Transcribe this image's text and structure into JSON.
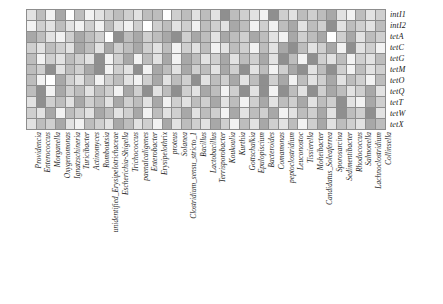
{
  "figure": {
    "type": "heatmap",
    "significance_marker": "*"
  },
  "chart_data": {
    "type": "heatmap",
    "title": "",
    "xlabel": "",
    "ylabel": "",
    "grid": true,
    "legend": "none",
    "colorscale": {
      "name": "grayscale",
      "levels": [
        "#ffffff",
        "#f2f2f2",
        "#e2e2e2",
        "#cfcfcf",
        "#bdbdbd",
        "#a8a8a8",
        "#8f8f8f"
      ],
      "low_label": "",
      "high_label": ""
    },
    "rows": [
      "intI1",
      "intI2",
      "tetA",
      "tetC",
      "tetG",
      "tetM",
      "tetO",
      "tetQ",
      "tetT",
      "tetW",
      "tetX"
    ],
    "columns": [
      "Providencia",
      "Enterococcus",
      "Morganella",
      "Oxygenomonas",
      "Ignatzschineria",
      "Turicibacter",
      "Actinomyces",
      "Romboutsia",
      "unidentified_Erysipelotrichaceae",
      "Escherichia-Shigella",
      "Trichococcus",
      "paenalcaligenes",
      "Enterobacter",
      "Erysipelothrix",
      "proteus",
      "Solanea",
      "Clostridium_sensu_stricto_1",
      "Bacillus",
      "Lactobacillus",
      "Terrisporobacter",
      "Koukoulia",
      "Kurthia",
      "Gottschalkia",
      "Epulopiscium",
      "Bacteroides",
      "Comamonas",
      "peptoclostridium",
      "Leuconostoc",
      "Tissierella",
      "Moheibacter",
      "Candidatus_Soleaferrea",
      "Sporosarcina",
      "Sedimentibacter",
      "Rhodococcus",
      "Salmonella",
      "Lachnoclostridium",
      "Collinsella"
    ],
    "values": [
      [
        2,
        4,
        1,
        5,
        0,
        4,
        1,
        2,
        3,
        4,
        3,
        2,
        4,
        4,
        0,
        3,
        4,
        2,
        4,
        2,
        6,
        4,
        3,
        2,
        1,
        6,
        3,
        2,
        4,
        3,
        4,
        5,
        2,
        1,
        4,
        2,
        3
      ],
      [
        1,
        3,
        2,
        4,
        2,
        1,
        3,
        1,
        4,
        2,
        1,
        3,
        0,
        3,
        4,
        2,
        3,
        1,
        4,
        3,
        2,
        5,
        4,
        1,
        3,
        1,
        4,
        5,
        2,
        4,
        3,
        6,
        2,
        4,
        3,
        2,
        4
      ],
      [
        5,
        4,
        2,
        1,
        3,
        5,
        4,
        3,
        0,
        7,
        4,
        5,
        3,
        4,
        5,
        7,
        3,
        5,
        4,
        2,
        5,
        4,
        3,
        5,
        4,
        2,
        1,
        5,
        3,
        4,
        5,
        0,
        3,
        5,
        2,
        4,
        3
      ],
      [
        3,
        2,
        4,
        3,
        2,
        5,
        4,
        2,
        5,
        3,
        4,
        5,
        3,
        2,
        4,
        1,
        3,
        2,
        4,
        1,
        2,
        4,
        3,
        1,
        4,
        2,
        5,
        6,
        4,
        2,
        3,
        5,
        1,
        7,
        2,
        3,
        1
      ],
      [
        4,
        1,
        3,
        2,
        4,
        3,
        2,
        6,
        1,
        3,
        5,
        1,
        4,
        2,
        5,
        1,
        5,
        4,
        2,
        3,
        5,
        2,
        4,
        3,
        5,
        2,
        6,
        4,
        1,
        7,
        3,
        2,
        4,
        1,
        3,
        2,
        4
      ],
      [
        4,
        3,
        6,
        2,
        4,
        3,
        5,
        6,
        1,
        3,
        2,
        6,
        1,
        5,
        4,
        2,
        5,
        3,
        4,
        2,
        5,
        3,
        6,
        2,
        4,
        1,
        3,
        5,
        7,
        2,
        4,
        6,
        3,
        1,
        4,
        2,
        3
      ],
      [
        4,
        1,
        0,
        5,
        3,
        2,
        4,
        1,
        3,
        4,
        2,
        1,
        3,
        5,
        2,
        4,
        3,
        7,
        2,
        4,
        3,
        5,
        2,
        4,
        6,
        3,
        5,
        1,
        4,
        2,
        3,
        5,
        2,
        4,
        3,
        1,
        4
      ],
      [
        4,
        6,
        1,
        5,
        3,
        4,
        2,
        4,
        3,
        1,
        5,
        3,
        6,
        2,
        4,
        6,
        3,
        2,
        5,
        4,
        1,
        3,
        7,
        2,
        6,
        1,
        7,
        4,
        2,
        7,
        3,
        5,
        4,
        2,
        3,
        5,
        2
      ],
      [
        2,
        6,
        3,
        4,
        2,
        5,
        3,
        4,
        2,
        5,
        3,
        4,
        2,
        5,
        1,
        3,
        2,
        4,
        3,
        5,
        2,
        4,
        1,
        3,
        5,
        2,
        4,
        3,
        5,
        2,
        4,
        3,
        6,
        2,
        1,
        5,
        3
      ],
      [
        3,
        2,
        5,
        1,
        4,
        3,
        2,
        5,
        4,
        2,
        3,
        5,
        1,
        4,
        2,
        3,
        5,
        2,
        4,
        3,
        1,
        5,
        2,
        4,
        3,
        5,
        1,
        2,
        4,
        3,
        5,
        2,
        6,
        4,
        3,
        6,
        2
      ],
      [
        2,
        4,
        3,
        5,
        2,
        1,
        4,
        3,
        2,
        5,
        4,
        2,
        3,
        1,
        5,
        2,
        4,
        3,
        2,
        5,
        3,
        1,
        4,
        2,
        5,
        3,
        2,
        4,
        1,
        3,
        5,
        2,
        4,
        3,
        2,
        5,
        4
      ]
    ],
    "significant_cells": [
      {
        "row": "tetA",
        "col": "Escherichia-Shigella"
      },
      {
        "row": "tetA",
        "col": "Solanea"
      },
      {
        "row": "tetC",
        "col": "Rhodococcus"
      },
      {
        "row": "tetG",
        "col": "Moheibacter"
      },
      {
        "row": "tetM",
        "col": "Tissierella"
      },
      {
        "row": "tetO",
        "col": "Bacillus"
      },
      {
        "row": "tetQ",
        "col": "Gottschalkia"
      },
      {
        "row": "tetQ",
        "col": "peptoclostridium"
      },
      {
        "row": "tetQ",
        "col": "Moheibacter"
      }
    ]
  }
}
